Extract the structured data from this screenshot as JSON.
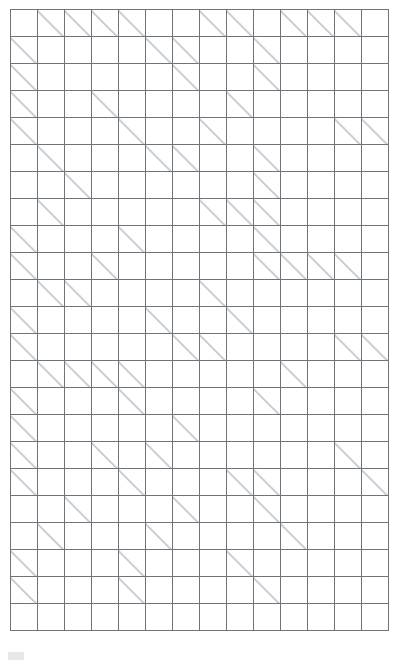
{
  "puzzle": {
    "name": "kakuro-grid",
    "type": "kakuro",
    "columns": 14,
    "rows": 23,
    "cell_size_px": 27,
    "colors": {
      "white_cell": "#ffffff",
      "black_cell": "#0a0a0a",
      "grid_line": "#6e7479",
      "clue_text": "#ffffff",
      "diagonal_line": "#c9ced3"
    },
    "legend": {
      "down_clue_position": "upper-right triangle",
      "across_clue_position": "lower-left triangle"
    },
    "cells": [
      [
        {
          "t": "b"
        },
        {
          "t": "c",
          "d": "11"
        },
        {
          "t": "c",
          "d": "33"
        },
        {
          "t": "c",
          "d": "3"
        },
        {
          "t": "c",
          "d": "15"
        },
        {
          "t": "b"
        },
        {
          "t": "b"
        },
        {
          "t": "c",
          "d": "20"
        },
        {
          "t": "c",
          "d": "3"
        },
        {
          "t": "b"
        },
        {
          "t": "c",
          "d": "34"
        },
        {
          "t": "c",
          "d": "22"
        },
        {
          "t": "c",
          "d": "7"
        },
        {
          "t": "b"
        }
      ],
      [
        {
          "t": "c",
          "a": "22"
        },
        {
          "t": "w"
        },
        {
          "t": "w"
        },
        {
          "t": "w"
        },
        {
          "t": "w"
        },
        {
          "t": "c",
          "a": "9"
        },
        {
          "t": "c",
          "d": "11"
        },
        {
          "t": "w"
        },
        {
          "t": "w"
        },
        {
          "t": "c",
          "d": "14"
        },
        {
          "t": "w"
        },
        {
          "t": "w"
        },
        {
          "t": "w"
        },
        {
          "t": "w"
        }
      ],
      [
        {
          "t": "c",
          "a": "16"
        },
        {
          "t": "w"
        },
        {
          "t": "w"
        },
        {
          "t": "w"
        },
        {
          "t": "w"
        },
        {
          "t": "w"
        },
        {
          "t": "c",
          "d": "4",
          "a": "17"
        },
        {
          "t": "w"
        },
        {
          "t": "w"
        },
        {
          "t": "c",
          "d": "23",
          "a": "4"
        },
        {
          "t": "w"
        },
        {
          "t": "w"
        },
        {
          "t": "w"
        },
        {
          "t": "w"
        }
      ],
      [
        {
          "t": "c",
          "a": "4"
        },
        {
          "t": "w"
        },
        {
          "t": "w"
        },
        {
          "t": "c",
          "d": "21",
          "a": "18"
        },
        {
          "t": "w"
        },
        {
          "t": "w"
        },
        {
          "t": "w"
        },
        {
          "t": "w"
        },
        {
          "t": "c",
          "d": "12",
          "a": "6"
        },
        {
          "t": "w"
        },
        {
          "t": "w"
        },
        {
          "t": "w"
        },
        {
          "t": "w"
        },
        {
          "t": "b"
        }
      ],
      [
        {
          "t": "c",
          "a": "11"
        },
        {
          "t": "w"
        },
        {
          "t": "w"
        },
        {
          "t": "w"
        },
        {
          "t": "c",
          "d": "14",
          "a": "9"
        },
        {
          "t": "w"
        },
        {
          "t": "w"
        },
        {
          "t": "c",
          "d": "16",
          "a": "10"
        },
        {
          "t": "w"
        },
        {
          "t": "w"
        },
        {
          "t": "w"
        },
        {
          "t": "w"
        },
        {
          "t": "c",
          "a": "15"
        },
        {
          "t": "c",
          "a": "14"
        }
      ],
      [
        {
          "t": "b"
        },
        {
          "t": "c",
          "d": "12"
        },
        {
          "t": "w"
        },
        {
          "t": "w"
        },
        {
          "t": "w"
        },
        {
          "t": "c",
          "a": "15"
        },
        {
          "t": "c",
          "d": "4",
          "a": "26"
        },
        {
          "t": "w"
        },
        {
          "t": "w"
        },
        {
          "t": "c",
          "d": "11"
        },
        {
          "t": "w"
        },
        {
          "t": "w"
        },
        {
          "t": "w"
        },
        {
          "t": "w"
        }
      ],
      [
        {
          "t": "b"
        },
        {
          "t": "b"
        },
        {
          "t": "c",
          "d": "35",
          "a": "20"
        },
        {
          "t": "w"
        },
        {
          "t": "w"
        },
        {
          "t": "w"
        },
        {
          "t": "w"
        },
        {
          "t": "b"
        },
        {
          "t": "b"
        },
        {
          "t": "c",
          "d": "16",
          "a": "4"
        },
        {
          "t": "w"
        },
        {
          "t": "w"
        },
        {
          "t": "w"
        },
        {
          "t": "w"
        }
      ],
      [
        {
          "t": "b"
        },
        {
          "t": "c",
          "d": "24",
          "a": "4"
        },
        {
          "t": "w"
        },
        {
          "t": "w"
        },
        {
          "t": "w"
        },
        {
          "t": "w"
        },
        {
          "t": "w"
        },
        {
          "t": "c",
          "a": "16"
        },
        {
          "t": "c",
          "a": "23"
        },
        {
          "t": "c",
          "d": "6"
        },
        {
          "t": "w"
        },
        {
          "t": "w"
        },
        {
          "t": "w"
        },
        {
          "t": "w"
        }
      ],
      [
        {
          "t": "c",
          "a": "15"
        },
        {
          "t": "w"
        },
        {
          "t": "w"
        },
        {
          "t": "w"
        },
        {
          "t": "c",
          "d": "27",
          "a": "28"
        },
        {
          "t": "w"
        },
        {
          "t": "w"
        },
        {
          "t": "w"
        },
        {
          "t": "w"
        },
        {
          "t": "c",
          "d": "7"
        },
        {
          "t": "w"
        },
        {
          "t": "w"
        },
        {
          "t": "w"
        },
        {
          "t": "w"
        }
      ],
      [
        {
          "t": "c",
          "a": "4"
        },
        {
          "t": "w"
        },
        {
          "t": "w"
        },
        {
          "t": "c",
          "d": "26",
          "a": "15"
        },
        {
          "t": "w"
        },
        {
          "t": "w"
        },
        {
          "t": "w"
        },
        {
          "t": "w"
        },
        {
          "t": "w"
        },
        {
          "t": "c",
          "a": "28"
        },
        {
          "t": "c",
          "a": "9"
        },
        {
          "t": "c",
          "a": "16"
        },
        {
          "t": "c",
          "a": "5"
        },
        {
          "t": "w"
        }
      ],
      [
        {
          "t": "b"
        },
        {
          "t": "c",
          "a": "16"
        },
        {
          "t": "c",
          "d": "7",
          "a": "5"
        },
        {
          "t": "w"
        },
        {
          "t": "w"
        },
        {
          "t": "w"
        },
        {
          "t": "b"
        },
        {
          "t": "c",
          "d": "34"
        },
        {
          "t": "w"
        },
        {
          "t": "w"
        },
        {
          "t": "w"
        },
        {
          "t": "w"
        },
        {
          "t": "w"
        },
        {
          "t": "w"
        }
      ],
      [
        {
          "t": "c",
          "a": "24"
        },
        {
          "t": "w"
        },
        {
          "t": "w"
        },
        {
          "t": "w"
        },
        {
          "t": "w"
        },
        {
          "t": "c",
          "a": "19"
        },
        {
          "t": "b"
        },
        {
          "t": "b"
        },
        {
          "t": "c",
          "d": "14",
          "a": "15"
        },
        {
          "t": "w"
        },
        {
          "t": "w"
        },
        {
          "t": "w"
        },
        {
          "t": "w"
        },
        {
          "t": "w"
        }
      ],
      [
        {
          "t": "c",
          "a": "34"
        },
        {
          "t": "w"
        },
        {
          "t": "w"
        },
        {
          "t": "w"
        },
        {
          "t": "w"
        },
        {
          "t": "w"
        },
        {
          "t": "c",
          "a": "5"
        },
        {
          "t": "c",
          "d": "12",
          "a": "27"
        },
        {
          "t": "w"
        },
        {
          "t": "w"
        },
        {
          "t": "w"
        },
        {
          "t": "w"
        },
        {
          "t": "c",
          "a": "22"
        },
        {
          "t": "c",
          "a": "16"
        }
      ],
      [
        {
          "t": "b"
        },
        {
          "t": "c",
          "a": "14"
        },
        {
          "t": "c",
          "a": "26"
        },
        {
          "t": "c",
          "a": "6"
        },
        {
          "t": "c",
          "d": "25"
        },
        {
          "t": "w"
        },
        {
          "t": "w"
        },
        {
          "t": "w"
        },
        {
          "t": "w"
        },
        {
          "t": "w"
        },
        {
          "t": "c",
          "d": "17",
          "a": "31"
        },
        {
          "t": "w"
        },
        {
          "t": "w"
        },
        {
          "t": "w"
        }
      ],
      [
        {
          "t": "c",
          "a": "22"
        },
        {
          "t": "w"
        },
        {
          "t": "w"
        },
        {
          "t": "w"
        },
        {
          "t": "c",
          "d": "26"
        },
        {
          "t": "w"
        },
        {
          "t": "w"
        },
        {
          "t": "w"
        },
        {
          "t": "w"
        },
        {
          "t": "c",
          "d": "15",
          "a": "6"
        },
        {
          "t": "w"
        },
        {
          "t": "w"
        },
        {
          "t": "w"
        },
        {
          "t": "w"
        }
      ],
      [
        {
          "t": "c",
          "a": "12"
        },
        {
          "t": "w"
        },
        {
          "t": "w"
        },
        {
          "t": "w"
        },
        {
          "t": "b"
        },
        {
          "t": "b"
        },
        {
          "t": "c",
          "d": "24",
          "a": "5"
        },
        {
          "t": "w"
        },
        {
          "t": "w"
        },
        {
          "t": "w"
        },
        {
          "t": "w"
        },
        {
          "t": "w"
        },
        {
          "t": "w"
        },
        {
          "t": "b"
        }
      ],
      [
        {
          "t": "c",
          "a": "4"
        },
        {
          "t": "w"
        },
        {
          "t": "w"
        },
        {
          "t": "c",
          "a": "28"
        },
        {
          "t": "b"
        },
        {
          "t": "c",
          "d": "26",
          "a": "7"
        },
        {
          "t": "w"
        },
        {
          "t": "w"
        },
        {
          "t": "w"
        },
        {
          "t": "w"
        },
        {
          "t": "w"
        },
        {
          "t": "w"
        },
        {
          "t": "c",
          "a": "25"
        },
        {
          "t": "b"
        }
      ],
      [
        {
          "t": "c",
          "a": "13"
        },
        {
          "t": "w"
        },
        {
          "t": "w"
        },
        {
          "t": "w"
        },
        {
          "t": "c",
          "d": "4",
          "a": "4"
        },
        {
          "t": "w"
        },
        {
          "t": "w"
        },
        {
          "t": "w"
        },
        {
          "t": "c",
          "a": "7"
        },
        {
          "t": "c",
          "d": "14",
          "a": "7"
        },
        {
          "t": "w"
        },
        {
          "t": "w"
        },
        {
          "t": "w"
        },
        {
          "t": "c",
          "a": "17"
        }
      ],
      [
        {
          "t": "b"
        },
        {
          "t": "b"
        },
        {
          "t": "c",
          "d": "7",
          "a": "11"
        },
        {
          "t": "w"
        },
        {
          "t": "w"
        },
        {
          "t": "w"
        },
        {
          "t": "c",
          "d": "4",
          "a": "10"
        },
        {
          "t": "w"
        },
        {
          "t": "w"
        },
        {
          "t": "c",
          "d": "8",
          "a": "21"
        },
        {
          "t": "w"
        },
        {
          "t": "w"
        },
        {
          "t": "w"
        },
        {
          "t": "w"
        }
      ],
      [
        {
          "t": "b"
        },
        {
          "t": "c",
          "d": "19",
          "a": "16"
        },
        {
          "t": "w"
        },
        {
          "t": "w"
        },
        {
          "t": "w"
        },
        {
          "t": "c",
          "d": "14",
          "a": "16"
        },
        {
          "t": "w"
        },
        {
          "t": "w"
        },
        {
          "t": "w"
        },
        {
          "t": "w"
        },
        {
          "t": "c",
          "d": "16",
          "a": "12"
        },
        {
          "t": "w"
        },
        {
          "t": "w"
        },
        {
          "t": "w"
        }
      ],
      [
        {
          "t": "c",
          "a": "12"
        },
        {
          "t": "w"
        },
        {
          "t": "w"
        },
        {
          "t": "w"
        },
        {
          "t": "c",
          "a": "9"
        },
        {
          "t": "w"
        },
        {
          "t": "w"
        },
        {
          "t": "w"
        },
        {
          "t": "c",
          "a": "16"
        },
        {
          "t": "w"
        },
        {
          "t": "w"
        },
        {
          "t": "w"
        },
        {
          "t": "w"
        },
        {
          "t": "w"
        }
      ],
      [
        {
          "t": "c",
          "a": "20"
        },
        {
          "t": "w"
        },
        {
          "t": "w"
        },
        {
          "t": "w"
        },
        {
          "t": "c",
          "a": "16"
        },
        {
          "t": "w"
        },
        {
          "t": "w"
        },
        {
          "t": "w"
        },
        {
          "t": "b"
        },
        {
          "t": "c",
          "a": "30"
        },
        {
          "t": "w"
        },
        {
          "t": "w"
        },
        {
          "t": "w"
        },
        {
          "t": "w"
        }
      ],
      [
        {
          "t": "w"
        },
        {
          "t": "w"
        },
        {
          "t": "w"
        },
        {
          "t": "w"
        },
        {
          "t": "w"
        },
        {
          "t": "w"
        },
        {
          "t": "w"
        },
        {
          "t": "w"
        },
        {
          "t": "w"
        },
        {
          "t": "w"
        },
        {
          "t": "w"
        },
        {
          "t": "w"
        },
        {
          "t": "w"
        },
        {
          "t": "w"
        }
      ]
    ]
  }
}
